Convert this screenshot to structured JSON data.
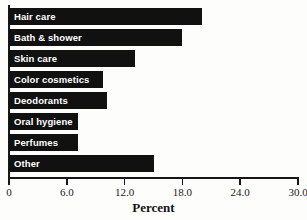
{
  "chart_data": {
    "type": "bar",
    "orientation": "horizontal",
    "title": "",
    "xlabel": "Percent",
    "ylabel": "",
    "xlim": [
      0,
      30
    ],
    "grid": false,
    "legend": null,
    "bar_color": "#111111",
    "label_color": "#ffffff",
    "axis_color": "#171717",
    "background": "#fdfdfc",
    "xticks": [
      "0",
      "6.0",
      "12.0",
      "18.0",
      "24.0",
      "30.0"
    ],
    "xtick_values": [
      0,
      6,
      12,
      18,
      24,
      30
    ],
    "categories": [
      "Hair care",
      "Bath & shower",
      "Skin care",
      "Color cosmetics",
      "Deodorants",
      "Oral hygiene",
      "Perfumes",
      "Other"
    ],
    "values": [
      20.0,
      18.0,
      13.1,
      9.8,
      10.2,
      7.2,
      7.2,
      15.0
    ],
    "bars": [
      {
        "label": "Hair care",
        "value": 20.0
      },
      {
        "label": "Bath & shower",
        "value": 18.0
      },
      {
        "label": "Skin care",
        "value": 13.1
      },
      {
        "label": "Color cosmetics",
        "value": 9.8
      },
      {
        "label": "Deodorants",
        "value": 10.2
      },
      {
        "label": "Oral hygiene",
        "value": 7.2
      },
      {
        "label": "Perfumes",
        "value": 7.2
      },
      {
        "label": "Other",
        "value": 15.0
      }
    ]
  }
}
